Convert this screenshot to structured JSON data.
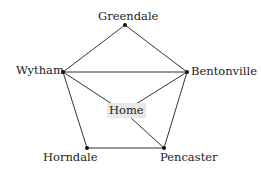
{
  "graph": {
    "nodes": [
      {
        "id": "greendale",
        "label": "Greendale",
        "x": 125,
        "y": 25
      },
      {
        "id": "wytham",
        "label": "Wytham",
        "x": 63,
        "y": 72
      },
      {
        "id": "bentonville",
        "label": "Bentonville",
        "x": 187,
        "y": 72
      },
      {
        "id": "horndale",
        "label": "Horndale",
        "x": 87,
        "y": 148
      },
      {
        "id": "pencaster",
        "label": "Pencaster",
        "x": 164,
        "y": 148
      },
      {
        "id": "home",
        "label": "Home",
        "x": 124,
        "y": 110
      }
    ],
    "edges": [
      [
        "greendale",
        "wytham"
      ],
      [
        "greendale",
        "bentonville"
      ],
      [
        "wytham",
        "bentonville"
      ],
      [
        "wytham",
        "horndale"
      ],
      [
        "wytham",
        "home"
      ],
      [
        "bentonville",
        "home"
      ],
      [
        "bentonville",
        "pencaster"
      ],
      [
        "home",
        "pencaster"
      ],
      [
        "horndale",
        "pencaster"
      ]
    ],
    "highlight_fill": "#e8e8e8",
    "edge_color": "#333333"
  }
}
